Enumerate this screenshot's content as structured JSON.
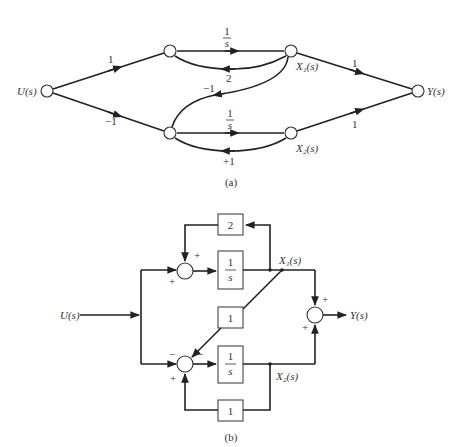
{
  "figure_a": {
    "caption": "(a)",
    "nodes": {
      "input": "U(s)",
      "x1": "X₁(s)",
      "x2": "X₂(s)",
      "output": "Y(s)"
    },
    "branch_gains": {
      "u_to_upper": "1",
      "u_to_lower": "−1",
      "upper_forward_num": "1",
      "upper_forward_den": "s",
      "upper_feedback": "2",
      "cross_feedback": "−1",
      "lower_forward_num": "1",
      "lower_forward_den": "s",
      "lower_feedback": "+1",
      "x1_to_y": "1",
      "x2_to_y": "1"
    }
  },
  "figure_b": {
    "caption": "(b)",
    "input": "U(s)",
    "output": "Y(s)",
    "x1": "X₁(s)",
    "x2": "X₂(s)",
    "blocks": {
      "upper_feedback": "2",
      "upper_integrator_num": "1",
      "upper_integrator_den": "s",
      "cross_gain": "1",
      "lower_integrator_num": "1",
      "lower_integrator_den": "s",
      "lower_feedback": "1"
    },
    "signs": {
      "top_sum_feedback": "+",
      "top_sum_input": "+",
      "bottom_sum_input": "−",
      "bottom_sum_cross": "−",
      "bottom_sum_feedback": "+",
      "out_sum_x1": "+",
      "out_sum_x2": "+"
    }
  }
}
